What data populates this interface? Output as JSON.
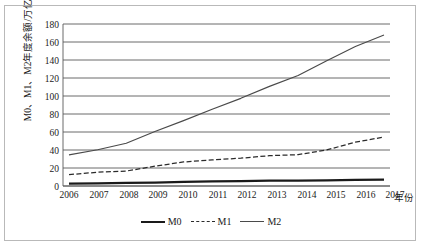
{
  "chart_data": {
    "type": "line",
    "title": "",
    "xlabel": "年份",
    "ylabel": "M0、M1、M2年度余额/万亿元",
    "categories": [
      "2006",
      "2007",
      "2008",
      "2009",
      "2010",
      "2011",
      "2012",
      "2013",
      "2014",
      "2015",
      "2016",
      "2017"
    ],
    "x": [
      2006,
      2007,
      2008,
      2009,
      2010,
      2011,
      2012,
      2013,
      2014,
      2015,
      2016,
      2017
    ],
    "ylim": [
      0,
      180
    ],
    "yticks": [
      0,
      20,
      40,
      60,
      80,
      100,
      120,
      140,
      160,
      180
    ],
    "grid": true,
    "legend_position": "bottom",
    "series": [
      {
        "name": "M0",
        "style": "solid-thick",
        "color": "#1a1a1a",
        "values": [
          2.7,
          3.0,
          3.4,
          3.8,
          4.5,
          5.1,
          5.5,
          5.9,
          6.0,
          6.3,
          6.8,
          7.1
        ]
      },
      {
        "name": "M1",
        "style": "dashed",
        "color": "#2b2b2b",
        "values": [
          12.6,
          15.3,
          16.6,
          22.0,
          26.7,
          29.0,
          30.9,
          33.7,
          34.8,
          40.1,
          48.7,
          54.4
        ]
      },
      {
        "name": "M2",
        "style": "solid-thin",
        "color": "#4a4a4a",
        "values": [
          34.6,
          40.3,
          47.5,
          60.6,
          72.6,
          85.2,
          97.4,
          110.7,
          122.8,
          139.2,
          155.0,
          167.7
        ]
      }
    ]
  },
  "axis": {
    "y_title": "M0、M1、M2年度余额/万亿元",
    "x_title": "年份",
    "y_ticks": [
      "180",
      "160",
      "140",
      "120",
      "100",
      "80",
      "60",
      "40",
      "20",
      "0"
    ],
    "x_ticks": [
      "2006",
      "2007",
      "2008",
      "2009",
      "2010",
      "2011",
      "2012",
      "2013",
      "2014",
      "2015",
      "2016",
      "2017"
    ]
  },
  "legend": {
    "items": [
      {
        "label": "M0"
      },
      {
        "label": "M1"
      },
      {
        "label": "M2"
      }
    ]
  },
  "colors": {
    "m0": "#1a1a1a",
    "m1": "#2b2b2b",
    "m2": "#4a4a4a",
    "grid": "#5a5a5a",
    "border": "#b9b9b9"
  }
}
